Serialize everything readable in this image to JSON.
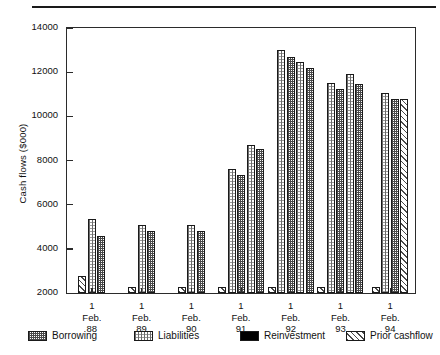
{
  "chart_data": {
    "type": "bar",
    "title": "",
    "xlabel": "",
    "ylabel": "Cash flows ($000)",
    "ylim": [
      2000,
      14000
    ],
    "ytick_step": 2000,
    "yticks": [
      2000,
      4000,
      6000,
      8000,
      10000,
      12000,
      14000
    ],
    "grid": false,
    "legend_position": "bottom",
    "categories": [
      "1\nFeb.\n88",
      "1\nFeb.\n89",
      "1\nFeb.\n90",
      "1\nFeb.\n91",
      "1\nFeb.\n92",
      "1\nFeb.\n93",
      "1\nFeb.\n94"
    ],
    "category_lines": [
      [
        "1",
        "Feb.",
        "88"
      ],
      [
        "1",
        "Feb.",
        "89"
      ],
      [
        "1",
        "Feb.",
        "90"
      ],
      [
        "1",
        "Feb.",
        "91"
      ],
      [
        "1",
        "Feb.",
        "92"
      ],
      [
        "1",
        "Feb.",
        "93"
      ],
      [
        "1",
        "Feb.",
        "94"
      ]
    ],
    "series": [
      {
        "name": "Prior cashflow",
        "pattern": "diagonal-hatch",
        "values": [
          2750,
          2250,
          2250,
          2250,
          2250,
          2250,
          2250
        ]
      },
      {
        "name": "Liabilities",
        "pattern": "vertical-dotted",
        "values": [
          5350,
          5100,
          5100,
          7600,
          13000,
          11500,
          11050
        ]
      },
      {
        "name": "Borrowing",
        "pattern": "checkerboard",
        "values": [
          4600,
          4800,
          4800,
          7350,
          12700,
          11250,
          10800
        ]
      }
    ],
    "extra_bars": [
      {
        "group": 3,
        "series": "Liabilities",
        "value": 8700
      },
      {
        "group": 3,
        "series": "Borrowing",
        "value": 8500
      },
      {
        "group": 4,
        "series": "Liabilities",
        "value": 12450
      },
      {
        "group": 4,
        "series": "Borrowing",
        "value": 12200
      },
      {
        "group": 5,
        "series": "Liabilities",
        "value": 11900
      },
      {
        "group": 5,
        "series": "Borrowing",
        "value": 11450
      },
      {
        "group": 6,
        "series": "Prior cashflow",
        "value": 10800
      }
    ]
  },
  "legend": {
    "items": [
      {
        "label": "Borrowing",
        "pattern": "checkerboard"
      },
      {
        "label": "Liabilities",
        "pattern": "vertical-dotted"
      },
      {
        "label": "Reinvestment",
        "pattern": "solid-black"
      },
      {
        "label": "Prior cashflow",
        "pattern": "diagonal-hatch"
      }
    ]
  },
  "axis": {
    "y_title": "Cash flows ($000)"
  },
  "colors": {
    "ink": "#1a1a1a",
    "axis": "#2b2b2b",
    "background": "#ffffff"
  }
}
